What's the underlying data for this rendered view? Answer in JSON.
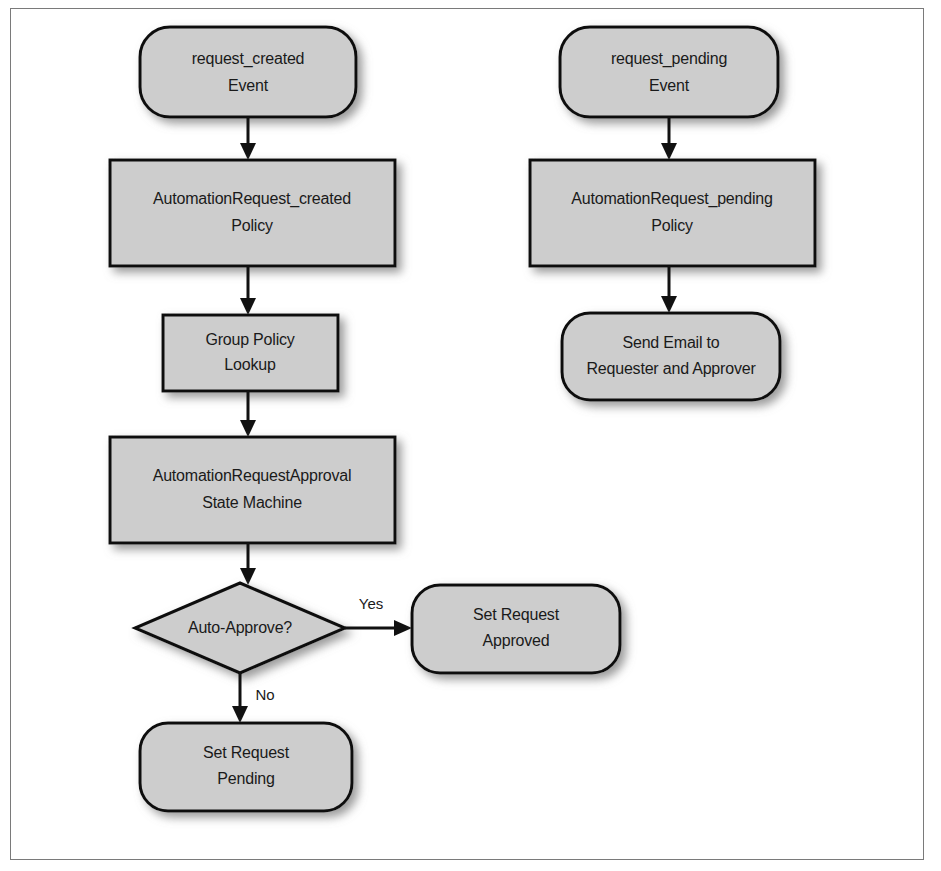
{
  "figure": {
    "colors": {
      "shape_fill": "#cdcdcd",
      "shape_stroke": "#111111",
      "text": "#1a1a1a",
      "frame_border": "#7a7a7a",
      "background": "#ffffff"
    }
  },
  "nodes": {
    "request_created_event": {
      "shape": "rounded-rectangle",
      "line1": "request_created",
      "line2": "Event"
    },
    "automation_request_created_policy": {
      "shape": "rectangle",
      "line1": "AutomationRequest_created",
      "line2": "Policy"
    },
    "group_policy_lookup": {
      "shape": "rectangle",
      "line1": "Group Policy",
      "line2": "Lookup"
    },
    "automation_request_approval_state_machine": {
      "shape": "rectangle",
      "line1": "AutomationRequestApproval",
      "line2": "State Machine"
    },
    "auto_approve_decision": {
      "shape": "diamond",
      "line1": "Auto-Approve?"
    },
    "set_request_approved": {
      "shape": "rounded-rectangle",
      "line1": "Set Request",
      "line2": "Approved"
    },
    "set_request_pending": {
      "shape": "rounded-rectangle",
      "line1": "Set Request",
      "line2": "Pending"
    },
    "request_pending_event": {
      "shape": "rounded-rectangle",
      "line1": "request_pending",
      "line2": "Event"
    },
    "automation_request_pending_policy": {
      "shape": "rectangle",
      "line1": "AutomationRequest_pending",
      "line2": "Policy"
    },
    "send_email": {
      "shape": "rounded-rectangle",
      "line1": "Send Email to",
      "line2": "Requester and Approver"
    }
  },
  "edges": {
    "yes_label": "Yes",
    "no_label": "No"
  }
}
